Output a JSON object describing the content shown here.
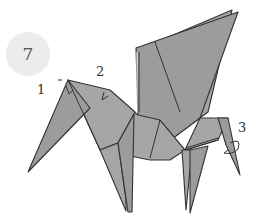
{
  "diagram": {
    "step_number": "7",
    "labels": [
      {
        "id": "1",
        "text": "1",
        "target": "ear fold (head tip)"
      },
      {
        "id": "2",
        "text": "2",
        "target": "neck fold"
      },
      {
        "id": "3",
        "text": "3",
        "target": "hind leg twist"
      }
    ],
    "colors": {
      "paper": "#a6a6a6",
      "outline": "#333333",
      "step_circle": "#ececec"
    }
  }
}
